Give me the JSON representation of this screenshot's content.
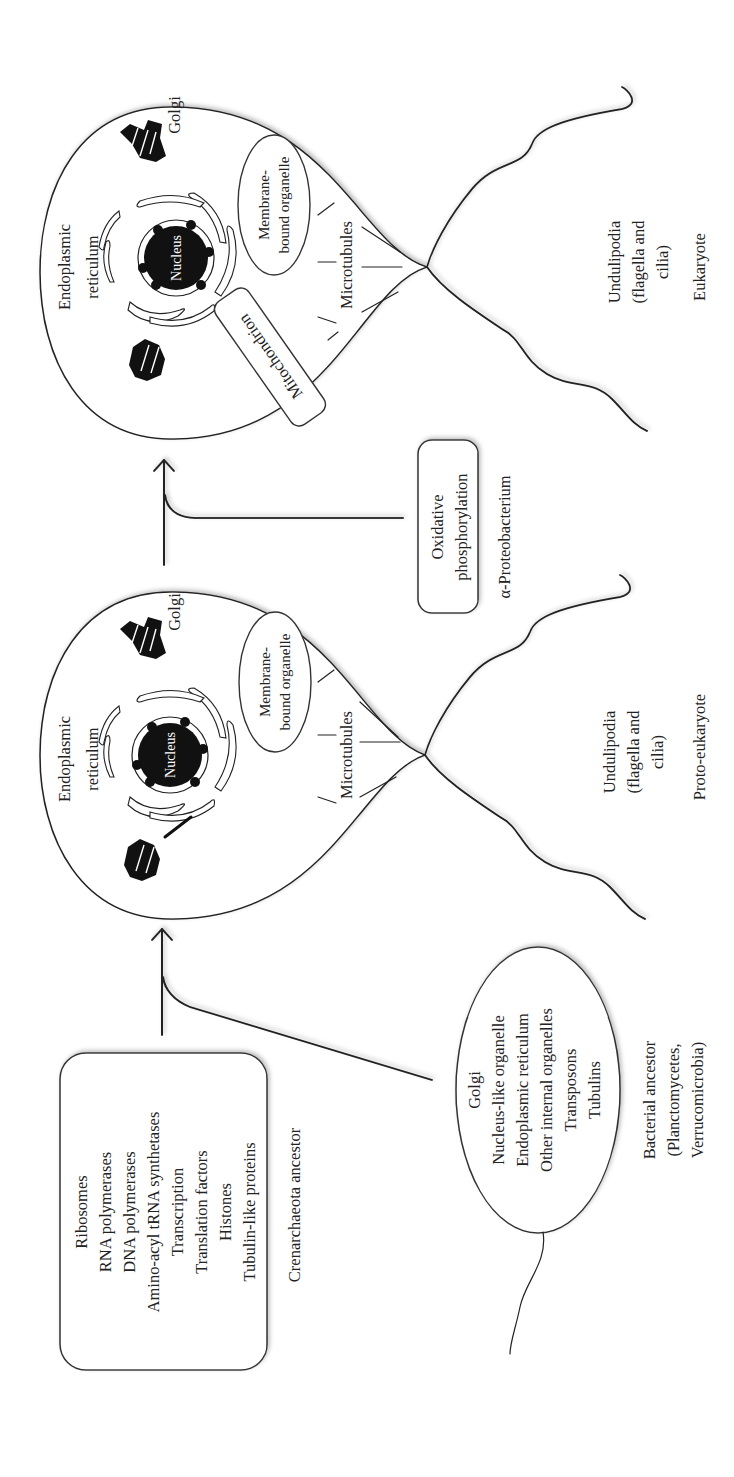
{
  "crenarchaeota": {
    "features": [
      "Ribosomes",
      "RNA polymerases",
      "DNA polymerases",
      "Amino-acyl tRNA synthetases",
      "Transcription",
      "Translation factors",
      "Histones",
      "Tubulin-like proteins"
    ],
    "label": "Crenarchaeota ancestor"
  },
  "bacterial": {
    "features": [
      "Golgi",
      "Nucleus-like organelle",
      "Endoplasmic reticulum",
      "Other internal organelles",
      "Transposons",
      "Tubulins"
    ],
    "label_lines": [
      "Bacterial ancestor",
      "(Planctomycetes,",
      "Verrucomicrobia)"
    ]
  },
  "proto_eukaryote": {
    "er_label_lines": [
      "Endoplasmic",
      "reticulum"
    ],
    "nucleus": "Nucleus",
    "golgi": "Golgi",
    "organelle_lines": [
      "Membrane-",
      "bound organelle"
    ],
    "microtubules": "Microtubules",
    "undulipodia_lines": [
      "Undulipodia",
      "(flagella and",
      "cilia)"
    ],
    "label": "Proto-eukaryote"
  },
  "alpha_proteobacterium": {
    "feature_lines": [
      "Oxidative",
      "phosphorylation"
    ],
    "label": "α-Proteobacterium"
  },
  "eukaryote": {
    "er_label_lines": [
      "Endoplasmic",
      "reticulum"
    ],
    "nucleus": "Nucleus",
    "golgi": "Golgi",
    "organelle_lines": [
      "Membrane-",
      "bound organelle"
    ],
    "mitochondrion": "Mitochondrion",
    "microtubules": "Microtubules",
    "undulipodia_lines": [
      "Undulipodia",
      "(flagella and",
      "cilia)"
    ],
    "label": "Eukaryote"
  }
}
